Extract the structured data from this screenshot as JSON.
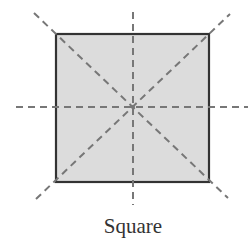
{
  "figure": {
    "caption": "Square",
    "shape": "square",
    "fill_color": "#dcdcdc",
    "stroke_color": "#333333",
    "axis_color": "#777777",
    "symmetry_lines": [
      {
        "name": "horizontal",
        "x1": 16,
        "y1": 107,
        "x2": 248,
        "y2": 107
      },
      {
        "name": "vertical",
        "x1": 133,
        "y1": 12,
        "x2": 133,
        "y2": 205
      },
      {
        "name": "diagonal-down",
        "x1": 34,
        "y1": 13,
        "x2": 228,
        "y2": 198
      },
      {
        "name": "diagonal-up",
        "x1": 36,
        "y1": 199,
        "x2": 230,
        "y2": 14
      }
    ],
    "square": {
      "x": 56,
      "y": 34,
      "width": 153,
      "height": 148
    }
  }
}
